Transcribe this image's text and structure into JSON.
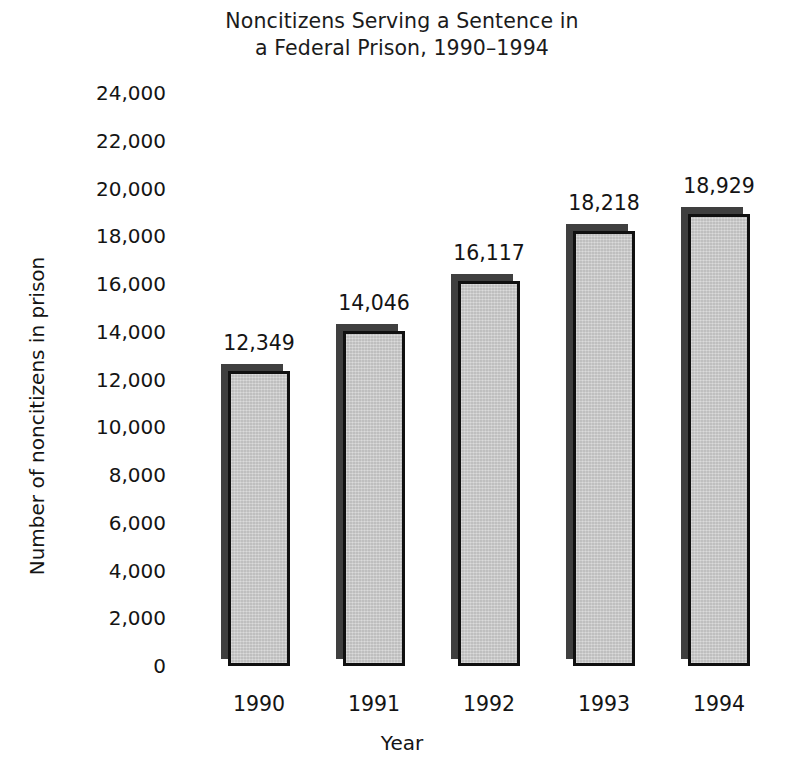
{
  "chart_data": {
    "type": "bar",
    "title": "Noncitizens Serving a Sentence in a Federal Prison, 1990–1994",
    "title_lines": [
      "Noncitizens Serving a Sentence in",
      "a Federal Prison, 1990–1994"
    ],
    "xlabel": "Year",
    "ylabel": "Number of noncitizens in prison",
    "categories": [
      "1990",
      "1991",
      "1992",
      "1993",
      "1994"
    ],
    "values": [
      12349,
      14046,
      16117,
      18218,
      18929
    ],
    "value_labels": [
      "12,349",
      "14,046",
      "16,117",
      "18,218",
      "18,929"
    ],
    "ylim": [
      0,
      24000
    ],
    "ytick_values": [
      24000,
      22000,
      20000,
      18000,
      16000,
      14000,
      12000,
      10000,
      8000,
      6000,
      4000,
      2000,
      0
    ],
    "ytick_labels": [
      "24,000",
      "22,000",
      "20,000",
      "18,000",
      "16,000",
      "14,000",
      "12,000",
      "10,000",
      "8,000",
      "6,000",
      "4,000",
      "2,000",
      "0"
    ],
    "grid": false,
    "axis_lines": false,
    "legend": null,
    "data_labels_shown": true,
    "colors": {
      "bar_face": "#c9c9c9",
      "bar_outline": "#101010",
      "bar_shadow": "#3f3f3f",
      "background": "#ffffff",
      "text": "#141414"
    }
  }
}
